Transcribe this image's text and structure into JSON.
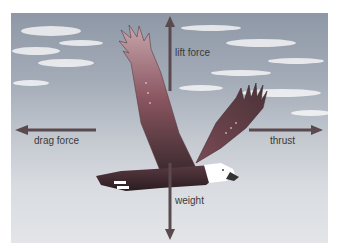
{
  "diagram": {
    "forces": [
      {
        "id": "lift",
        "label": "lift force",
        "direction": "up"
      },
      {
        "id": "drag",
        "label": "drag force",
        "direction": "left"
      },
      {
        "id": "thrust",
        "label": "thrust",
        "direction": "right"
      },
      {
        "id": "weight",
        "label": "weight",
        "direction": "down"
      }
    ],
    "colors": {
      "arrow": "#5a4a4e",
      "sky_top": "#8f98a6",
      "sky_bottom": "#e3e5e8",
      "wing": "#8a5560",
      "body": "#3a2a2e",
      "head": "#ffffff",
      "beak": "#333333"
    }
  }
}
